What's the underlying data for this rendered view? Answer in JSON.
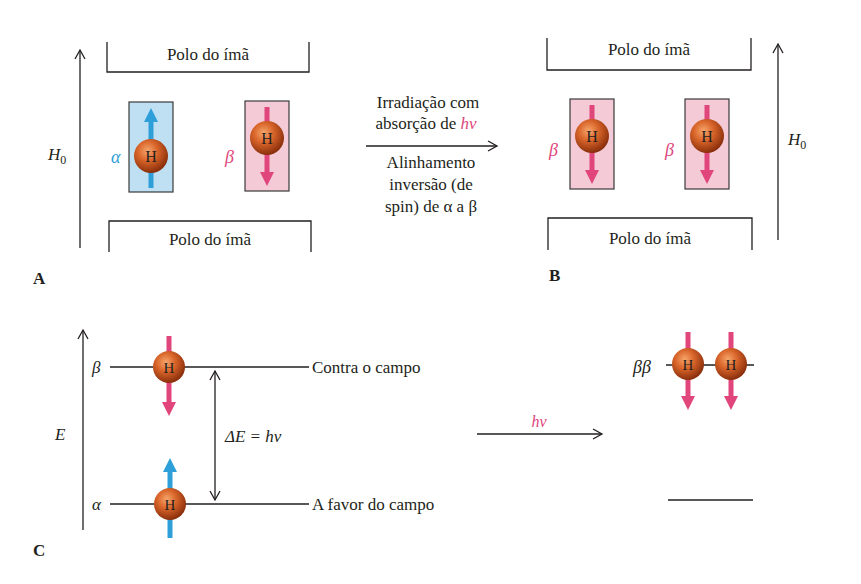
{
  "colors": {
    "alpha_blue": "#2e9fd9",
    "beta_pink": "#e0457b",
    "alpha_box_fill": "#bfe0f3",
    "beta_box_fill": "#f3cad6",
    "nucleus_fill": "#c8521c",
    "line": "#231f20"
  },
  "panel_a": {
    "label": "A",
    "field_label": "H",
    "field_sub": "0",
    "top_pole": "Polo do ímã",
    "bottom_pole": "Polo do ímã",
    "spins": [
      {
        "symbol": "α",
        "state": "alpha",
        "nucleus": "H",
        "direction": "up"
      },
      {
        "symbol": "β",
        "state": "beta",
        "nucleus": "H",
        "direction": "down"
      }
    ]
  },
  "transition": {
    "line1": "Irradiação com",
    "line2_prefix": "absorção de ",
    "line2_hv": "hν",
    "below": [
      "Alinhamento",
      "inversão (de",
      "spin) de α a β"
    ]
  },
  "panel_b": {
    "label": "B",
    "field_label": "H",
    "field_sub": "0",
    "top_pole": "Polo do ímã",
    "bottom_pole": "Polo do ímã",
    "spins": [
      {
        "symbol": "β",
        "state": "beta",
        "nucleus": "H",
        "direction": "down"
      },
      {
        "symbol": "β",
        "state": "beta",
        "nucleus": "H",
        "direction": "down"
      }
    ]
  },
  "panel_c": {
    "label": "C",
    "axis_label": "E",
    "beta_level": {
      "symbol": "β",
      "text": "Contra o campo"
    },
    "alpha_level": {
      "symbol": "α",
      "text": "A favor do campo"
    },
    "gap_label": "ΔE = hν",
    "arrow_label": "hν",
    "result_symbol": "ββ",
    "nucleus": "H"
  }
}
